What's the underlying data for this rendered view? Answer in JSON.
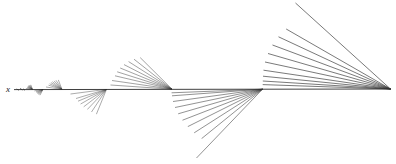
{
  "figure": {
    "title": "",
    "background_color": "#ffffff",
    "line_color": "#3a3a3a",
    "axis_line_color": "#2b2b2b",
    "width": 396,
    "height": 164,
    "axis_label": {
      "text": "x",
      "x": 6,
      "y": 85
    }
  },
  "chart_data": {
    "type": "line",
    "title": "",
    "xlabel": "x",
    "ylabel": "",
    "grid": false,
    "legend": null,
    "xlim": [
      0,
      396
    ],
    "ylim": [
      164,
      0
    ],
    "baseline_y": 89,
    "axis_segment": {
      "x1": 14,
      "y1": 89.6,
      "x2": 391,
      "y2": 89.0
    },
    "fans": [
      {
        "name": "fan-1",
        "apex": [
          32.5,
          89.4
        ],
        "side": "above",
        "scale": 0.035,
        "rays": [
          {
            "x": 27.2,
            "y": 87.6
          },
          {
            "x": 27.6,
            "y": 86.9
          },
          {
            "x": 28.1,
            "y": 86.3
          },
          {
            "x": 28.6,
            "y": 85.8
          },
          {
            "x": 29.2,
            "y": 85.4
          },
          {
            "x": 29.9,
            "y": 85.1
          },
          {
            "x": 30.8,
            "y": 84.8
          },
          {
            "x": 25.9,
            "y": 88.3
          }
        ]
      },
      {
        "name": "fan-2",
        "apex": [
          43.0,
          89.4
        ],
        "side": "below",
        "scale": 0.05,
        "rays": [
          {
            "x": 36.0,
            "y": 91.8
          },
          {
            "x": 36.6,
            "y": 92.6
          },
          {
            "x": 37.3,
            "y": 93.4
          },
          {
            "x": 38.1,
            "y": 94.1
          },
          {
            "x": 39.0,
            "y": 94.7
          },
          {
            "x": 40.0,
            "y": 95.2
          },
          {
            "x": 34.4,
            "y": 90.9
          }
        ]
      },
      {
        "name": "fan-3",
        "apex": [
          62.0,
          89.4
        ],
        "side": "above",
        "scale": 0.09,
        "rays": [
          {
            "x": 48.5,
            "y": 85.2
          },
          {
            "x": 49.6,
            "y": 83.8
          },
          {
            "x": 50.9,
            "y": 82.6
          },
          {
            "x": 52.4,
            "y": 81.7
          },
          {
            "x": 54.1,
            "y": 80.9
          },
          {
            "x": 56.0,
            "y": 80.3
          },
          {
            "x": 58.3,
            "y": 79.9
          },
          {
            "x": 46.0,
            "y": 87.0
          }
        ]
      },
      {
        "name": "fan-4",
        "apex": [
          106.5,
          89.3
        ],
        "side": "below",
        "scale": 0.2,
        "rays": [
          {
            "x": 76.0,
            "y": 98.5
          },
          {
            "x": 78.0,
            "y": 101.2
          },
          {
            "x": 80.6,
            "y": 104.0
          },
          {
            "x": 83.7,
            "y": 106.8
          },
          {
            "x": 87.3,
            "y": 109.5
          },
          {
            "x": 91.5,
            "y": 112.0
          },
          {
            "x": 96.4,
            "y": 114.2
          },
          {
            "x": 70.5,
            "y": 94.0
          }
        ]
      },
      {
        "name": "fan-5",
        "apex": [
          172.0,
          89.2
        ],
        "side": "above",
        "scale": 0.3,
        "rays": [
          {
            "x": 115.0,
            "y": 75.8
          },
          {
            "x": 117.2,
            "y": 71.8
          },
          {
            "x": 120.2,
            "y": 68.0
          },
          {
            "x": 124.0,
            "y": 64.6
          },
          {
            "x": 128.6,
            "y": 61.6
          },
          {
            "x": 134.0,
            "y": 59.2
          },
          {
            "x": 140.2,
            "y": 57.6
          },
          {
            "x": 112.0,
            "y": 80.5
          },
          {
            "x": 110.5,
            "y": 85.0
          }
        ]
      },
      {
        "name": "fan-6",
        "apex": [
          262.5,
          89.2
        ],
        "side": "below",
        "scale": 0.45,
        "rays": [
          {
            "x": 173.0,
            "y": 101.5
          },
          {
            "x": 175.0,
            "y": 107.5
          },
          {
            "x": 178.2,
            "y": 113.8
          },
          {
            "x": 182.5,
            "y": 120.2
          },
          {
            "x": 187.8,
            "y": 126.6
          },
          {
            "x": 194.2,
            "y": 132.8
          },
          {
            "x": 201.6,
            "y": 138.6
          },
          {
            "x": 196.5,
            "y": 158.0
          },
          {
            "x": 172.0,
            "y": 95.8
          },
          {
            "x": 171.6,
            "y": 92.8
          }
        ]
      },
      {
        "name": "fan-7",
        "apex": [
          390.5,
          89.0
        ],
        "side": "above",
        "scale": 0.7,
        "rays": [
          {
            "x": 263.5,
            "y": 70.2
          },
          {
            "x": 265.0,
            "y": 62.0
          },
          {
            "x": 268.0,
            "y": 53.5
          },
          {
            "x": 272.5,
            "y": 45.0
          },
          {
            "x": 278.5,
            "y": 36.8
          },
          {
            "x": 286.2,
            "y": 29.0
          },
          {
            "x": 295.5,
            "y": 3.0
          },
          {
            "x": 263.0,
            "y": 76.2
          },
          {
            "x": 262.8,
            "y": 81.0
          },
          {
            "x": 262.7,
            "y": 84.6
          }
        ]
      }
    ],
    "micro_marks": [
      {
        "name": "micro-tick-1",
        "x1": 16.5,
        "y1": 89.0,
        "x2": 19.0,
        "y2": 90.2
      },
      {
        "name": "micro-tick-2",
        "x1": 20.0,
        "y1": 88.4,
        "x2": 22.5,
        "y2": 90.0
      },
      {
        "name": "micro-tick-3",
        "x1": 23.0,
        "y1": 88.8,
        "x2": 25.0,
        "y2": 90.3
      }
    ]
  }
}
